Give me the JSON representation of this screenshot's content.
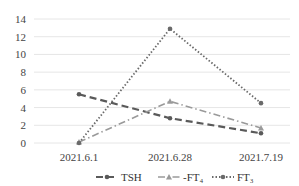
{
  "chart_data": {
    "type": "line",
    "title": "",
    "xlabel": "",
    "ylabel": "",
    "categories": [
      "2021.6.1",
      "2021.6.28",
      "2021.7.19"
    ],
    "ylim": [
      0,
      14
    ],
    "yticks": [
      0,
      2,
      4,
      6,
      8,
      10,
      12,
      14
    ],
    "grid": true,
    "legend_position": "bottom",
    "series": [
      {
        "name": "TSH",
        "values": [
          5.5,
          2.8,
          1.1
        ],
        "style": "dashed",
        "marker": "circle",
        "color": "#5a5a5a"
      },
      {
        "name": "FT4",
        "values": [
          0.1,
          4.7,
          1.7
        ],
        "style": "dash-dot",
        "marker": "triangle",
        "color": "#9a9a9a"
      },
      {
        "name": "FT3",
        "values": [
          0.0,
          12.9,
          4.5
        ],
        "style": "dotted",
        "marker": "circle",
        "color": "#6a6a6a"
      }
    ]
  },
  "legend": {
    "items": [
      {
        "label": "TSH"
      },
      {
        "label": "FT4",
        "display": "-FT₄"
      },
      {
        "label": "FT3",
        "display": "FT₃"
      }
    ]
  }
}
